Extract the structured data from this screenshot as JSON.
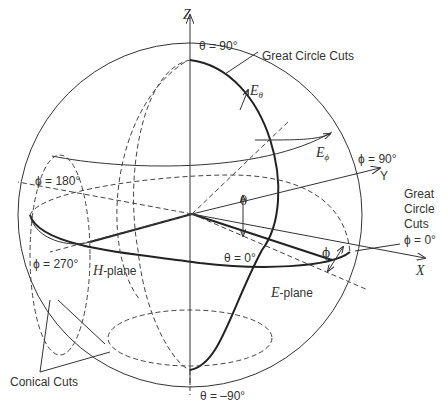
{
  "diagram": {
    "axes": {
      "z": "Z",
      "y": "Y",
      "x": "X"
    },
    "labels": {
      "theta_90": "θ = 90°",
      "theta_0": "θ = 0°",
      "theta_neg90": "θ = –90°",
      "phi_90": "ϕ = 90°",
      "phi_180": "ϕ = 180°",
      "phi_270": "ϕ = 270°",
      "phi_0": "ϕ = 0°",
      "theta_sym": "θ",
      "phi_sym": "ϕ",
      "e_theta_base": "E",
      "e_theta_sub": "θ",
      "e_phi_base": "E",
      "e_phi_sub": "ϕ",
      "great_circle_top": "Great Circle Cuts",
      "great_circle_right_1": "Great",
      "great_circle_right_2": "Circle",
      "great_circle_right_3": "Cuts",
      "h_plane_prefix": "H",
      "h_plane_suffix": "-plane",
      "e_plane_prefix": "E",
      "e_plane_suffix": "-plane",
      "conical_cuts": "Conical Cuts"
    },
    "colors": {
      "line": "#333333",
      "background": "#ffffff"
    }
  }
}
